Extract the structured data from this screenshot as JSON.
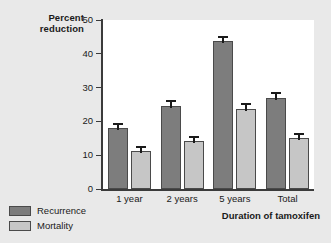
{
  "chart_data": {
    "type": "bar",
    "title": "",
    "xlabel": "Duration of tamoxifen",
    "ylabel": "Percent reduction",
    "ylabel_lines": [
      "Percent",
      "reduction"
    ],
    "categories": [
      "1 year",
      "2 years",
      "5 years",
      "Total"
    ],
    "ylim": [
      0,
      50
    ],
    "yticks": [
      0,
      10,
      20,
      30,
      40,
      50
    ],
    "ytick_labels": [
      "0",
      "10",
      "20",
      "30",
      "40",
      "50"
    ],
    "grid": false,
    "legend_position": "bottom-left",
    "series": [
      {
        "name": "Recurrence",
        "color": "#7d7d7d",
        "values": [
          18.0,
          24.5,
          43.8,
          27.0
        ],
        "errors": [
          1.6,
          1.7,
          1.6,
          1.6
        ]
      },
      {
        "name": "Mortality",
        "color": "#c6c6c6",
        "values": [
          11.2,
          14.2,
          23.8,
          15.2
        ],
        "errors": [
          1.5,
          1.5,
          1.6,
          1.5
        ]
      }
    ]
  },
  "colors": {
    "background": "#e9e9e9",
    "plot_background": "#ffffff",
    "axis": "#3b3b3b",
    "recurrence": "#7d7d7d",
    "mortality": "#c6c6c6"
  }
}
